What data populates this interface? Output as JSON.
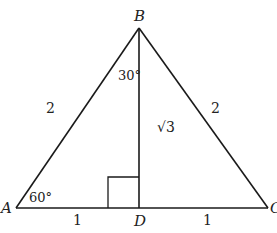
{
  "diagram": {
    "type": "triangle",
    "vertices": {
      "A": {
        "label": "A",
        "x": 16,
        "y": 208
      },
      "B": {
        "label": "B",
        "x": 139,
        "y": 28
      },
      "C": {
        "label": "C",
        "x": 268,
        "y": 208
      },
      "D": {
        "label": "D",
        "x": 139,
        "y": 208
      }
    },
    "side_labels": {
      "AB": "2",
      "BC": "2",
      "BD": "√3",
      "AD": "1",
      "DC": "1"
    },
    "angle_labels": {
      "A": "60°",
      "ABD": "30°"
    },
    "right_angle_marker": "D",
    "colors": {
      "stroke": "#1a1a1a",
      "text": "#222222",
      "background": "#ffffff"
    }
  }
}
